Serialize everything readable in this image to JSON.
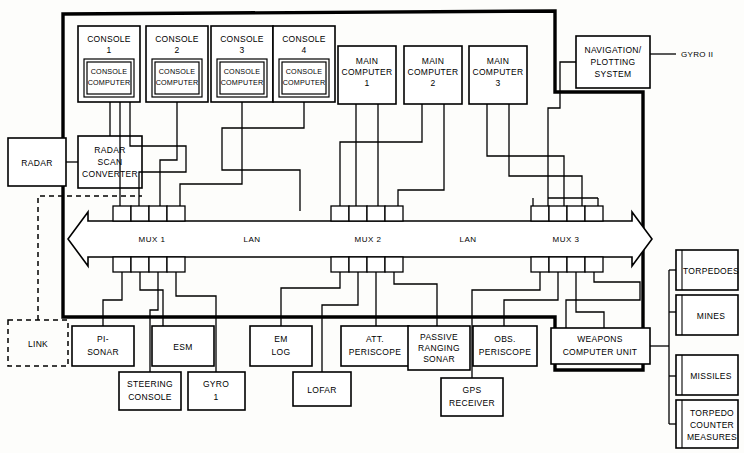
{
  "diagram": {
    "type": "block-diagram",
    "background_color": "#fdfdfb",
    "line_color": "#000000",
    "box_fill": "#ffffff"
  },
  "consoles": [
    {
      "label_line1": "CONSOLE",
      "label_line2": "1",
      "inner_line1": "CONSOLE",
      "inner_line2": "COMPUTER"
    },
    {
      "label_line1": "CONSOLE",
      "label_line2": "2",
      "inner_line1": "CONSOLE",
      "inner_line2": "COMPUTER"
    },
    {
      "label_line1": "CONSOLE",
      "label_line2": "3",
      "inner_line1": "CONSOLE",
      "inner_line2": "COMPUTER"
    },
    {
      "label_line1": "CONSOLE",
      "label_line2": "4",
      "inner_line1": "CONSOLE",
      "inner_line2": "COMPUTER"
    }
  ],
  "main_computers": [
    {
      "line1": "MAIN",
      "line2": "COMPUTER",
      "line3": "1"
    },
    {
      "line1": "MAIN",
      "line2": "COMPUTER",
      "line3": "2"
    },
    {
      "line1": "MAIN",
      "line2": "COMPUTER",
      "line3": "3"
    }
  ],
  "navigation": {
    "line1": "NAVIGATION/",
    "line2": "PLOTTING",
    "line3": "SYSTEM",
    "external_label": "GYRO II"
  },
  "radar": {
    "label": "RADAR",
    "converter_line1": "RADAR",
    "converter_line2": "SCAN",
    "converter_line3": "CONVERTER"
  },
  "link": {
    "label": "LINK"
  },
  "bus": {
    "mux1": "MUX 1",
    "mux2": "MUX 2",
    "mux3": "MUX 3",
    "lan_left": "LAN",
    "lan_right": "LAN",
    "ports_per_mux_top": 4,
    "ports_per_mux_bottom": 4
  },
  "sensors_row1": [
    {
      "line1": "PI-",
      "line2": "SONAR"
    },
    {
      "line1": "ESM",
      "line2": ""
    },
    {
      "line1": "EM",
      "line2": "LOG"
    },
    {
      "line1": "ATT.",
      "line2": "PERISCOPE"
    },
    {
      "line1": "PASSIVE",
      "line2": "RANGING",
      "line3": "SONAR"
    },
    {
      "line1": "OBS.",
      "line2": "PERISCOPE"
    }
  ],
  "sensors_row2": [
    {
      "line1": "STEERING",
      "line2": "CONSOLE"
    },
    {
      "line1": "GYRO",
      "line2": "1"
    },
    {
      "line1": "LOFAR",
      "line2": ""
    },
    {
      "line1": "GPS",
      "line2": "RECEIVER"
    }
  ],
  "weapons": {
    "unit_line1": "WEAPONS",
    "unit_line2": "COMPUTER UNIT",
    "effectors": [
      {
        "line1": "TORPEDOES",
        "line2": "",
        "line3": ""
      },
      {
        "line1": "MINES",
        "line2": "",
        "line3": ""
      },
      {
        "line1": "MISSILES",
        "line2": "",
        "line3": ""
      },
      {
        "line1": "TORPEDO",
        "line2": "COUNTER",
        "line3": "MEASURES"
      }
    ]
  }
}
